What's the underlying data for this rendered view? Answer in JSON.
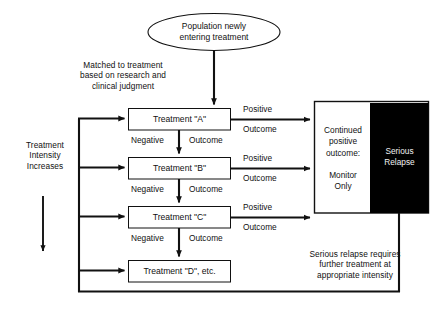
{
  "diagram": {
    "start_node": {
      "shape": "ellipse",
      "label": "Population newly\nentering treatment"
    },
    "entry_note": "Matched to treatment\nbased on research and\nclinical judgment",
    "intensity_note": "Treatment\nIntensity\nIncreases",
    "treatments": [
      {
        "label": "Treatment \"A\""
      },
      {
        "label": "Treatment \"B\""
      },
      {
        "label": "Treatment \"C\""
      },
      {
        "label": "Treatment \"D\", etc."
      }
    ],
    "negative_labels": [
      {
        "left": "Negative",
        "right": "Outcome"
      },
      {
        "left": "Negative",
        "right": "Outcome"
      },
      {
        "left": "Negative",
        "right": "Outcome"
      }
    ],
    "positive_labels": [
      {
        "top": "Positive",
        "bottom": "Outcome"
      },
      {
        "top": "Positive",
        "bottom": "Outcome"
      },
      {
        "top": "Positive",
        "bottom": "Outcome"
      }
    ],
    "outcome_panel": {
      "positive_text": "Continued\npositive\noutcome:",
      "monitor_text": "Monitor\nOnly",
      "relapse_text": "Serious\nRelapse"
    },
    "relapse_note": "Serious relapse requires\nfurther treatment at\nappropriate intensity",
    "colors": {
      "background": "#ffffff",
      "stroke": "#111111",
      "box_fill": "#ffffff",
      "relapse_fill": "#000000",
      "relapse_text": "#f2f2f2"
    }
  }
}
